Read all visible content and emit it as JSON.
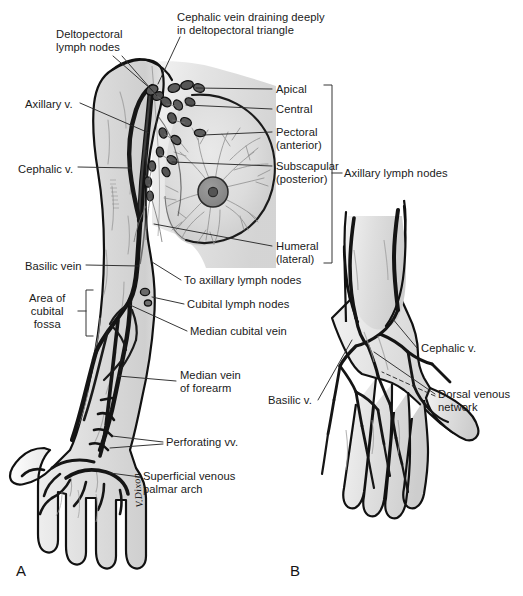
{
  "figure": {
    "panels": [
      {
        "id": "A",
        "label": "A",
        "caption": "Anterior view of upper limb, axilla and breast"
      },
      {
        "id": "B",
        "label": "B",
        "caption": "Dorsum of the hand"
      }
    ],
    "signature": "V.Dixon",
    "colors": {
      "outline": "#111111",
      "skin_fill": "#d7d7d7",
      "skin_fill_light": "#e6e6e6",
      "vein_dark": "#181818",
      "vein_mid": "#4a4a4a",
      "node_fill": "#585858",
      "node_stroke": "#111111",
      "breast_tissue": "#9a9a9a",
      "leader_line": "#2b2b2b",
      "text": "#1a1a1a",
      "background": "#ffffff"
    }
  },
  "labels_panel_a": [
    {
      "id": "deltopectoral-lymph-nodes",
      "text": "Deltopectoral\nlymph nodes",
      "x": 56,
      "y": 28,
      "align": "left"
    },
    {
      "id": "cephalic-vein-deltopectoral",
      "text": "Cephalic vein draining deeply\nin deltopectoral triangle",
      "x": 177,
      "y": 11,
      "align": "left"
    },
    {
      "id": "axillary-v",
      "text": "Axillary v.",
      "x": 25,
      "y": 98,
      "align": "left"
    },
    {
      "id": "cephalic-v",
      "text": "Cephalic v.",
      "x": 18,
      "y": 163,
      "align": "left"
    },
    {
      "id": "basilic-vein",
      "text": "Basilic vein",
      "x": 25,
      "y": 260,
      "align": "left"
    },
    {
      "id": "area-of-cubital-fossa",
      "text": "Area of\ncubital\nfossa",
      "x": 29,
      "y": 295,
      "align": "left"
    },
    {
      "id": "apical",
      "text": "Apical",
      "x": 275,
      "y": 85,
      "align": "left"
    },
    {
      "id": "central",
      "text": "Central",
      "x": 275,
      "y": 105,
      "align": "left"
    },
    {
      "id": "pectoral-anterior",
      "text": "Pectoral\n(anterior)",
      "x": 275,
      "y": 128,
      "align": "left"
    },
    {
      "id": "subscapular-posterior",
      "text": "Subscapular\n(posterior)",
      "x": 275,
      "y": 162,
      "align": "left"
    },
    {
      "id": "humeral-lateral",
      "text": "Humeral\n(lateral)",
      "x": 275,
      "y": 241,
      "align": "left"
    },
    {
      "id": "axillary-lymph-nodes",
      "text": "Axillary lymph nodes",
      "x": 345,
      "y": 168,
      "align": "left"
    },
    {
      "id": "to-axillary-lymph-nodes",
      "text": "To axillary lymph nodes",
      "x": 184,
      "y": 276,
      "align": "left"
    },
    {
      "id": "cubital-lymph-nodes",
      "text": "Cubital lymph nodes",
      "x": 187,
      "y": 300,
      "align": "left"
    },
    {
      "id": "median-cubital-vein",
      "text": "Median cubital vein",
      "x": 190,
      "y": 327,
      "align": "left"
    },
    {
      "id": "median-vein-of-forearm",
      "text": "Median vein\nof forearm",
      "x": 180,
      "y": 371,
      "align": "left"
    },
    {
      "id": "perforating-vv",
      "text": "Perforating vv.",
      "x": 166,
      "y": 438,
      "align": "left"
    },
    {
      "id": "superficial-venous-palmar-arch",
      "text": "Superficial venous\npalmar arch",
      "x": 143,
      "y": 472,
      "align": "left"
    }
  ],
  "labels_panel_b": [
    {
      "id": "cephalic-v-b",
      "text": "Cephalic v.",
      "x": 420,
      "y": 344,
      "align": "left"
    },
    {
      "id": "basilic-v-b",
      "text": "Basilic v.",
      "x": 269,
      "y": 396,
      "align": "left"
    },
    {
      "id": "dorsal-venous-network",
      "text": "Dorsal venous\nnetwork",
      "x": 438,
      "y": 390,
      "align": "left"
    }
  ],
  "brackets": [
    {
      "id": "axillary-lymph-nodes-bracket",
      "x": 332,
      "y_top": 85,
      "y_bottom": 263,
      "arm": 8
    },
    {
      "id": "cubital-fossa-bracket",
      "x": 86,
      "y_top": 290,
      "y_bottom": 336,
      "arm": 7
    }
  ],
  "anatomy_structures": {
    "panel_a": [
      "deltopectoral lymph nodes",
      "cephalic vein",
      "axillary vein",
      "basilic vein",
      "median cubital vein",
      "median vein of forearm",
      "perforating veins",
      "superficial venous palmar arch",
      "cubital lymph nodes",
      "apical axillary nodes",
      "central axillary nodes",
      "pectoral (anterior) nodes",
      "subscapular (posterior) nodes",
      "humeral (lateral) nodes",
      "breast with nipple and areola",
      "mammary lymphatic plexus"
    ],
    "panel_b": [
      "cephalic vein",
      "basilic vein",
      "dorsal venous network",
      "dorsal metacarpal veins",
      "dorsal digital veins"
    ]
  }
}
